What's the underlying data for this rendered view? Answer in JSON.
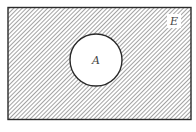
{
  "diagram": {
    "type": "venn",
    "universal_set_label": "E",
    "sets": [
      {
        "label": "A",
        "shaded": false
      }
    ],
    "shaded_region": "complement of A (A')",
    "colors": {
      "stroke": "#2a2a2a",
      "hatch": "#555555",
      "background": "#ffffff"
    }
  }
}
